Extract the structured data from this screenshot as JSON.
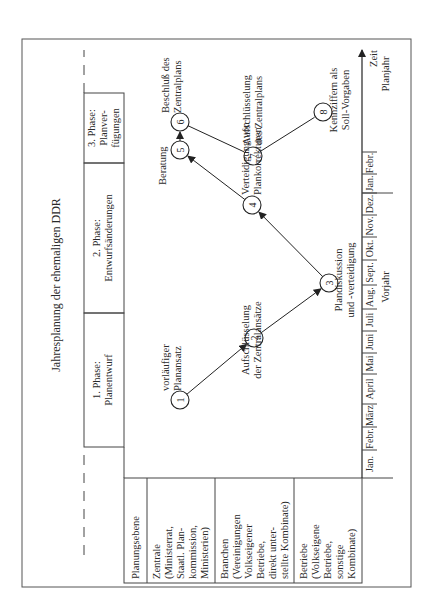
{
  "title": "Jahresplanung der ehemaligen DDR",
  "phases": [
    {
      "line1": "1. Phase:",
      "line2": "Planentwurf"
    },
    {
      "line1": "2. Phase:",
      "line2": "Entwurfsänderungen"
    },
    {
      "line1": "3. Phase:",
      "line2": "Planver-",
      "line3": "fügungen"
    }
  ],
  "levels": {
    "header": "Planungsebene",
    "rows": [
      {
        "lines": [
          "Zentrale",
          "(Ministerrat,",
          "Staatl. Plan-",
          "kommission,",
          "Ministerien)"
        ]
      },
      {
        "lines": [
          "Branchen",
          "(Vereinigungen",
          "Volkseigener",
          "Betriebe,",
          "direkt unter-",
          "stellte Kombinate)"
        ]
      },
      {
        "lines": [
          "Betriebe",
          "(Volkseigene",
          "Betriebe,",
          "sonstige",
          "Kombinate)"
        ]
      }
    ]
  },
  "steps": [
    {
      "num": "1",
      "label_lines": [
        "vorläufiger",
        "Planansatz"
      ]
    },
    {
      "num": "2",
      "label_lines": [
        "Aufschlüsselung",
        "der Zentralansätze"
      ]
    },
    {
      "num": "3",
      "label_lines": [
        "Plandiskussion",
        "und -verteidigung"
      ]
    },
    {
      "num": "4",
      "label_lines": [
        "Verteidigung von",
        "Plankorrekturen"
      ]
    },
    {
      "num": "5",
      "label_lines": [
        "Beratung"
      ]
    },
    {
      "num": "6",
      "label_lines": [
        "Beschluß des",
        "Zentralplans"
      ]
    },
    {
      "num": "7",
      "label_lines": [
        "Aufschlüsselung",
        "des Zentralplans"
      ]
    },
    {
      "num": "8",
      "label_lines": [
        "Kennziffern als",
        "Soll-Vorgaben"
      ]
    }
  ],
  "timeline": {
    "months": [
      "Jan.",
      "Febr.",
      "März",
      "April",
      "Mai",
      "Juni",
      "Juli",
      "Aug.",
      "Sept.",
      "Okt.",
      "Nov.",
      "Dez.",
      "Jan.",
      "Febr."
    ],
    "prior_year_label": "Vorjahr",
    "plan_year_label": "Planjahr",
    "axis_label": "Zeit"
  }
}
